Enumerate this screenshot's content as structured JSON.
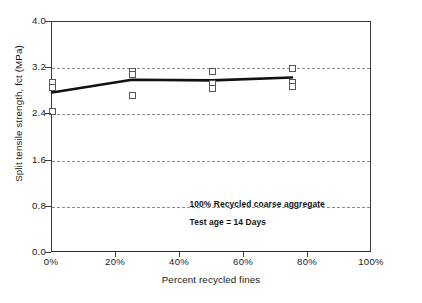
{
  "chart_data": {
    "type": "scatter",
    "title": "",
    "xlabel": "Percent recycled fines",
    "ylabel": "Split tensile strength, fct (MPa)",
    "xlim": [
      0,
      100
    ],
    "ylim": [
      0,
      4.0
    ],
    "xticks": [
      0,
      20,
      40,
      60,
      80,
      100
    ],
    "xtick_labels": [
      "0%",
      "20%",
      "40%",
      "60%",
      "80%",
      "100%"
    ],
    "yticks": [
      0.0,
      0.8,
      1.6,
      2.4,
      3.2,
      4.0
    ],
    "ytick_labels": [
      "0.0",
      "0.8",
      "1.6",
      "2.4",
      "3.2",
      "4.0"
    ],
    "grid": "horizontal-dashed",
    "legend": "none",
    "marker_style": "open-square",
    "points": [
      {
        "x": 0,
        "y": 2.96
      },
      {
        "x": 0,
        "y": 2.87
      },
      {
        "x": 0,
        "y": 2.45
      },
      {
        "x": 25,
        "y": 3.15
      },
      {
        "x": 25,
        "y": 3.09
      },
      {
        "x": 25,
        "y": 2.72
      },
      {
        "x": 50,
        "y": 3.15
      },
      {
        "x": 50,
        "y": 2.93
      },
      {
        "x": 50,
        "y": 2.85
      },
      {
        "x": 75,
        "y": 3.2
      },
      {
        "x": 75,
        "y": 2.95
      },
      {
        "x": 75,
        "y": 2.88
      }
    ],
    "series": [
      {
        "name": "mean trend",
        "style": "thick-black-line",
        "x": [
          0,
          25,
          50,
          75
        ],
        "values": [
          2.78,
          3.0,
          2.99,
          3.04
        ]
      }
    ],
    "annotations": [
      {
        "text": "100% Recycled coarse aggregate",
        "x": 43,
        "y": 0.93
      },
      {
        "text": "Test age = 14 Days",
        "x": 43,
        "y": 0.62
      }
    ]
  },
  "caption": {
    "text": ""
  }
}
